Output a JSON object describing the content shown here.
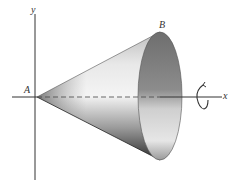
{
  "figure": {
    "type": "cone-of-revolution",
    "labels": {
      "y_axis": "y",
      "x_axis": "x",
      "apex": "A",
      "rim_point": "B"
    },
    "rotation_indicator": "rotation-about-x-axis",
    "colors": {
      "axis": "#333333",
      "cone_light": "#f2f2f2",
      "cone_dark": "#3a3a3a",
      "base_mid": "#8a8a8a"
    }
  }
}
